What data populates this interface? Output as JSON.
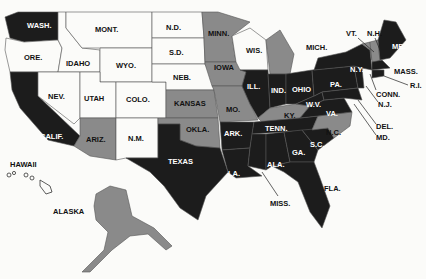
{
  "map": {
    "title": "",
    "legend": [],
    "colors": {
      "white": "#fbfbf9",
      "gray": "#8a8a8a",
      "black": "#1c1c1c"
    },
    "states": [
      {
        "label": "WASH.",
        "shade": "black"
      },
      {
        "label": "ORE.",
        "shade": "white"
      },
      {
        "label": "CALIF.",
        "shade": "black"
      },
      {
        "label": "IDAHO",
        "shade": "white"
      },
      {
        "label": "NEV.",
        "shade": "white"
      },
      {
        "label": "MONT.",
        "shade": "white"
      },
      {
        "label": "WYO.",
        "shade": "white"
      },
      {
        "label": "UTAH",
        "shade": "white"
      },
      {
        "label": "COLO.",
        "shade": "white"
      },
      {
        "label": "ARIZ.",
        "shade": "gray"
      },
      {
        "label": "N.M.",
        "shade": "white"
      },
      {
        "label": "N.D.",
        "shade": "white"
      },
      {
        "label": "S.D.",
        "shade": "white"
      },
      {
        "label": "NEB.",
        "shade": "white"
      },
      {
        "label": "KANSAS",
        "shade": "gray"
      },
      {
        "label": "OKLA.",
        "shade": "gray"
      },
      {
        "label": "TEXAS",
        "shade": "black"
      },
      {
        "label": "MINN.",
        "shade": "gray"
      },
      {
        "label": "IOWA",
        "shade": "gray"
      },
      {
        "label": "MO.",
        "shade": "gray"
      },
      {
        "label": "ARK.",
        "shade": "black"
      },
      {
        "label": "LA.",
        "shade": "black"
      },
      {
        "label": "WIS.",
        "shade": "white"
      },
      {
        "label": "ILL.",
        "shade": "black"
      },
      {
        "label": "MICH.",
        "shade": "gray"
      },
      {
        "label": "IND.",
        "shade": "black"
      },
      {
        "label": "OHIO",
        "shade": "black"
      },
      {
        "label": "KY.",
        "shade": "gray"
      },
      {
        "label": "TENN.",
        "shade": "black"
      },
      {
        "label": "MISS.",
        "shade": "black"
      },
      {
        "label": "ALA.",
        "shade": "black"
      },
      {
        "label": "GA.",
        "shade": "black"
      },
      {
        "label": "FLA.",
        "shade": "black"
      },
      {
        "label": "S.C.",
        "shade": "black"
      },
      {
        "label": "N.C.",
        "shade": "gray"
      },
      {
        "label": "VA.",
        "shade": "black"
      },
      {
        "label": "W.V.",
        "shade": "black"
      },
      {
        "label": "MD.",
        "shade": "black"
      },
      {
        "label": "DEL.",
        "shade": "black"
      },
      {
        "label": "PA.",
        "shade": "black"
      },
      {
        "label": "N.J.",
        "shade": "black"
      },
      {
        "label": "N.Y.",
        "shade": "black"
      },
      {
        "label": "CONN.",
        "shade": "black"
      },
      {
        "label": "R.I.",
        "shade": "black"
      },
      {
        "label": "MASS.",
        "shade": "black"
      },
      {
        "label": "VT.",
        "shade": "gray"
      },
      {
        "label": "N.H.",
        "shade": "gray"
      },
      {
        "label": "ME.",
        "shade": "black"
      },
      {
        "label": "HAWAII",
        "shade": "white"
      },
      {
        "label": "ALASKA",
        "shade": "gray"
      }
    ]
  }
}
